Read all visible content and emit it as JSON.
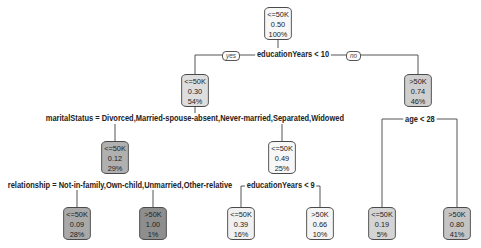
{
  "tree": {
    "split_labels": {
      "yes": "yes",
      "no": "no"
    },
    "colors": {
      "line": "#555555",
      "leaf_light": "#f4f4f4",
      "leaf_mid": "#dcdcdc",
      "leaf_dark": "#a9a9a9",
      "border": "#4a4a4a"
    },
    "nodes": [
      {
        "id": "root",
        "class": "<=50K",
        "prob": "0.50",
        "pct": "100%",
        "fill": "#f7f7f7"
      },
      {
        "id": "n2",
        "class": "<=50K",
        "prob": "0.30",
        "pct": "54%",
        "fill": "#dedede"
      },
      {
        "id": "n3",
        "class": ">50K",
        "prob": "0.74",
        "pct": "46%",
        "fill": "#cfcfcf"
      },
      {
        "id": "n4",
        "class": "<=50K",
        "prob": "0.12",
        "pct": "29%",
        "fill": "#b0b0b0"
      },
      {
        "id": "n5",
        "class": "<=50K",
        "prob": "0.49",
        "pct": "25%",
        "fill": "#f7f7f7"
      },
      {
        "id": "n8",
        "class": "<=50K",
        "prob": "0.09",
        "pct": "28%",
        "fill": "#a9a9a9"
      },
      {
        "id": "n9",
        "class": ">50K",
        "prob": "1.00",
        "pct": "1%",
        "fill": "#8e8e8e"
      },
      {
        "id": "n10",
        "class": "<=50K",
        "prob": "0.39",
        "pct": "16%",
        "fill": "#f0f0f0"
      },
      {
        "id": "n11",
        "class": ">50K",
        "prob": "0.66",
        "pct": "10%",
        "fill": "#f4f4f4"
      },
      {
        "id": "n6",
        "class": "<=50K",
        "prob": "0.19",
        "pct": "5%",
        "fill": "#d4d4d4"
      },
      {
        "id": "n7",
        "class": ">50K",
        "prob": "0.80",
        "pct": "41%",
        "fill": "#c4c4c4"
      }
    ],
    "splits": {
      "root": "educationYears < 10",
      "n2": "maritalStatus = Divorced,Married-spouse-absent,Never-married,Separated,Widowed",
      "n3": "age < 28",
      "n4": "relationship = Not-in-family,Own-child,Unmarried,Other-relative",
      "n5": "educationYears < 9"
    }
  }
}
